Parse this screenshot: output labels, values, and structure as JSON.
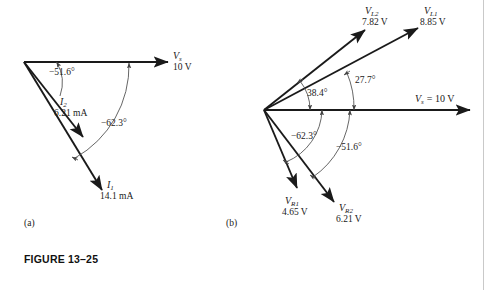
{
  "figure": {
    "caption": "FIGURE 13–25",
    "panels": [
      {
        "id": "a",
        "label": "(a)"
      },
      {
        "id": "b",
        "label": "(b)"
      }
    ]
  },
  "panel_a": {
    "title": "(a)",
    "source_phasor": {
      "name": "V",
      "subscript": "s",
      "magnitude": "10 V"
    },
    "phasors": [
      {
        "name": "I",
        "subscript": "2",
        "magnitude": "6.21 mA",
        "angle_deg": -51.6
      },
      {
        "name": "I",
        "subscript": "1",
        "magnitude": "14.1 mA",
        "angle_deg": -62.3
      }
    ],
    "angles": [
      {
        "text": "−51.6°",
        "value_deg": -51.6
      },
      {
        "text": "−62.3°",
        "value_deg": -62.3
      }
    ]
  },
  "panel_b": {
    "title": "(b)",
    "source_phasor": {
      "label": "V",
      "subscript": "s",
      "equals": "= 10 V"
    },
    "phasors": [
      {
        "name": "V",
        "subscript": "L2",
        "magnitude": "7.82 V",
        "angle_deg": 38.4
      },
      {
        "name": "V",
        "subscript": "L1",
        "magnitude": "8.85 V",
        "angle_deg": 27.7
      },
      {
        "name": "V",
        "subscript": "R1",
        "magnitude": "4.65 V",
        "angle_deg": -62.3
      },
      {
        "name": "V",
        "subscript": "R2",
        "magnitude": "6.21 V",
        "angle_deg": -51.6
      }
    ],
    "angles": [
      {
        "text": "38.4°",
        "value_deg": 38.4
      },
      {
        "text": "27.7°",
        "value_deg": 27.7
      },
      {
        "text": "−62.3°",
        "value_deg": -62.3
      },
      {
        "text": "−51.6°",
        "value_deg": -51.6
      }
    ]
  },
  "colors": {
    "ink": "#1a1a1a",
    "arc": "#555555",
    "page": "#ffffff",
    "rule": "#c9c9c9"
  }
}
